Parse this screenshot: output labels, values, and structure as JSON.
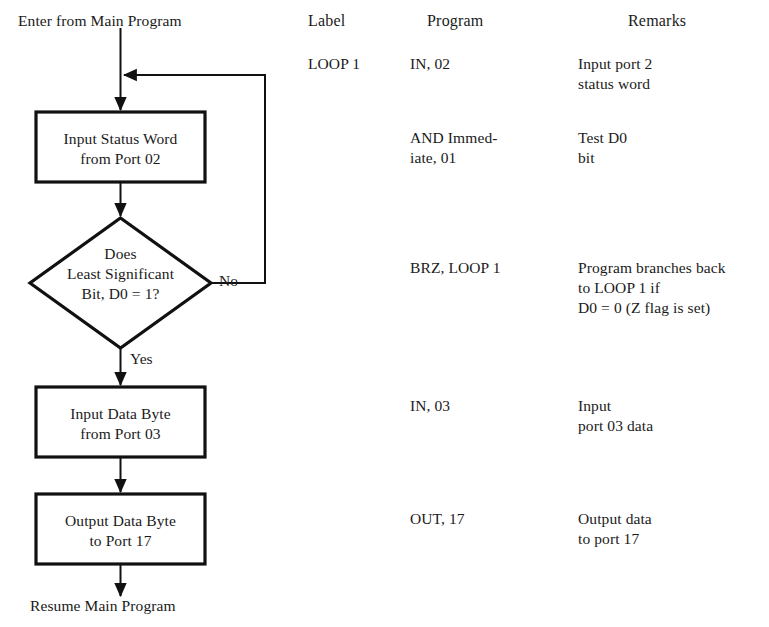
{
  "figure": {
    "type": "program-flowchart-with-listing",
    "entry_label": "Enter from Main Program",
    "exit_label": "Resume Main Program",
    "branch_labels": {
      "no": "No",
      "yes": "Yes"
    },
    "nodes": [
      {
        "id": "input-status-word",
        "shape": "process",
        "lines": [
          "Input Status Word",
          "from Port 02"
        ]
      },
      {
        "id": "test-d0",
        "shape": "decision",
        "lines": [
          "Does",
          "Least Significant",
          "Bit, D0 = 1?"
        ]
      },
      {
        "id": "input-data-byte",
        "shape": "process",
        "lines": [
          "Input Data Byte",
          "from Port 03"
        ]
      },
      {
        "id": "output-data-byte",
        "shape": "process",
        "lines": [
          "Output Data Byte",
          "to Port 17"
        ]
      }
    ]
  },
  "listing": {
    "headers": {
      "label": "Label",
      "program": "Program",
      "remarks": "Remarks"
    },
    "rows": [
      {
        "label": "LOOP 1",
        "program": "IN, 02",
        "remarks": "Input port 2\nstatus word"
      },
      {
        "label": "",
        "program": "AND Immed-\niate, 01",
        "remarks": "Test D0\nbit"
      },
      {
        "label": "",
        "program": "BRZ, LOOP 1",
        "remarks": "Program branches back\nto LOOP 1 if\nD0 = 0 (Z flag is set)"
      },
      {
        "label": "",
        "program": "IN, 03",
        "remarks": "Input\nport 03 data"
      },
      {
        "label": "",
        "program": "OUT, 17",
        "remarks": "Output data\nto port 17"
      }
    ]
  },
  "colors": {
    "ink": "#1a1a1a",
    "paper": "#ffffff",
    "stroke": "#111111"
  }
}
